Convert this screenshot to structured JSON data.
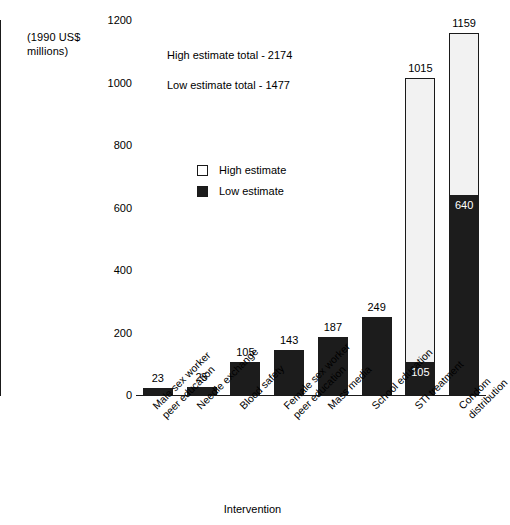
{
  "chart_data": {
    "type": "bar",
    "title": "",
    "subtitle": "",
    "xlabel": "Intervention",
    "ylabel": "(1990 US$\nmillions)",
    "ylim": [
      0,
      1200
    ],
    "yticks": [
      0,
      200,
      400,
      600,
      800,
      1000,
      1200
    ],
    "grid": false,
    "legend_position": "inside-upper-left",
    "stacking": "overlay",
    "categories": [
      "Male sex worker\npeer education",
      "Needle exchange",
      "Blood safety",
      "Female sex worker\npeer education",
      "Mass media",
      "School education",
      "STI treatment",
      "Condom distribution"
    ],
    "series": [
      {
        "name": "High estimate",
        "color": "#ffffff",
        "values": [
          23,
          25,
          105,
          143,
          187,
          249,
          1015,
          1159
        ]
      },
      {
        "name": "Low estimate",
        "color": "#1c1c1c",
        "values": [
          23,
          25,
          105,
          143,
          187,
          249,
          105,
          640
        ]
      }
    ],
    "bar_labels": [
      {
        "category": "Male sex worker peer education",
        "top_label": "23",
        "inner_label": ""
      },
      {
        "category": "Needle exchange",
        "top_label": "25",
        "inner_label": ""
      },
      {
        "category": "Blood safety",
        "top_label": "105",
        "inner_label": ""
      },
      {
        "category": "Female sex worker peer education",
        "top_label": "143",
        "inner_label": ""
      },
      {
        "category": "Mass media",
        "top_label": "187",
        "inner_label": ""
      },
      {
        "category": "School education",
        "top_label": "249",
        "inner_label": ""
      },
      {
        "category": "STI treatment",
        "top_label": "1015",
        "inner_label": "105"
      },
      {
        "category": "Condom distribution",
        "top_label": "1159",
        "inner_label": "640"
      }
    ],
    "annotations": [
      "High estimate total - 2174",
      "Low estimate total - 1477"
    ]
  },
  "axis": {
    "y_unit_caption": "(1990 US$\nmillions)",
    "y_tick_labels": [
      "1200",
      "1000",
      "800",
      "600",
      "400",
      "200",
      "0"
    ],
    "x_title": "Intervention"
  },
  "legend": {
    "items": [
      {
        "label": "High estimate",
        "swatch": "white-square"
      },
      {
        "label": "Low estimate",
        "swatch": "black-square"
      }
    ]
  },
  "annotations": {
    "high_total": "High estimate total - 2174",
    "low_total": "Low estimate total - 1477"
  },
  "colors": {
    "high_estimate": "#f2f2f2",
    "low_estimate": "#1c1c1c",
    "axis": "#1a1a1a",
    "background": "#ffffff"
  }
}
